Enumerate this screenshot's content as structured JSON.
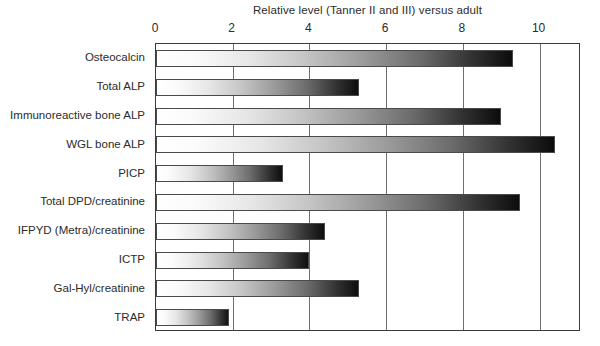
{
  "chart_data": {
    "type": "bar",
    "orientation": "horizontal",
    "title": "Relative level (Tanner II and III) versus adult",
    "xlabel": "",
    "ylabel": "",
    "xlim": [
      0,
      11.08
    ],
    "grid": true,
    "legend": false,
    "xticks": [
      0,
      2,
      4,
      6,
      8,
      10
    ],
    "xtick_labels": [
      "0",
      "2",
      "4",
      "6",
      "8",
      "10"
    ],
    "categories": [
      "Osteocalcin",
      "Total ALP",
      "Immunoreactive bone ALP",
      "WGL bone ALP",
      "PICP",
      "Total DPD/creatinine",
      "IFPYD (Metra)/creatinine",
      "ICTP",
      "Gal-Hyl/creatinine",
      "TRAP"
    ],
    "values": [
      9.3,
      5.3,
      9.0,
      10.4,
      3.3,
      9.5,
      4.4,
      4.0,
      5.3,
      1.9
    ]
  },
  "style": {
    "bar_gradient_start": "#ffffff",
    "bar_gradient_end": "#0a0a0a",
    "bar_outline": "#4a4a4a",
    "frame_color": "#3b3b3b",
    "gridline_color": "#6f6f6f",
    "text_color": "#2b2b2b",
    "background": "#ffffff"
  }
}
